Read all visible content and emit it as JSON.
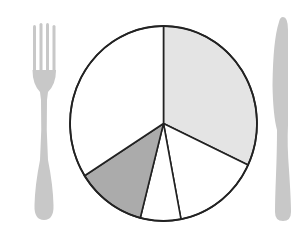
{
  "chart_data": {
    "type": "pie",
    "title": "",
    "subtitle": "",
    "legend": [],
    "annotations": [],
    "start_angle_deg": 0,
    "direction": "clockwise",
    "slices": [
      {
        "label": "",
        "value": 32,
        "color": "#e4e4e4"
      },
      {
        "label": "",
        "value": 15,
        "color": "#ffffff"
      },
      {
        "label": "",
        "value": 7,
        "color": "#ffffff"
      },
      {
        "label": "",
        "value": 12,
        "color": "#ababab"
      },
      {
        "label": "",
        "value": 34,
        "color": "#ffffff"
      }
    ],
    "categories": [
      "slice-1",
      "slice-2",
      "slice-3",
      "slice-4",
      "slice-5"
    ],
    "values": [
      32,
      15,
      7,
      12,
      34
    ]
  },
  "decoration": {
    "plate_style": "pie chart drawn as dinner plate",
    "fork_icon": "fork-icon",
    "knife_icon": "knife-icon",
    "cutlery_color": "#c8c8c8",
    "outline_color": "#222222"
  }
}
